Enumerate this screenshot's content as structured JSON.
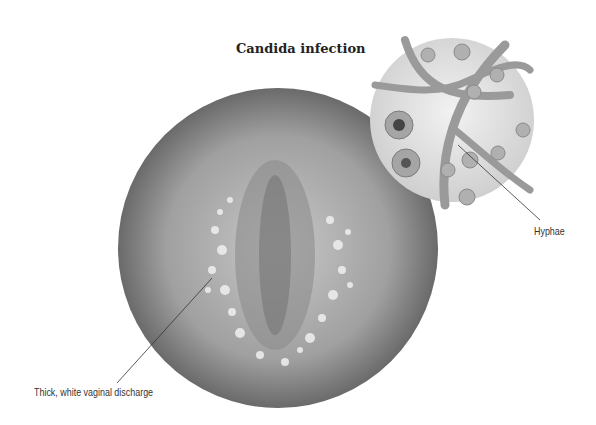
{
  "figure": {
    "title": "Candida infection",
    "labels": {
      "discharge": "Thick, white vaginal discharge",
      "hyphae": "Hyphae"
    },
    "palette": {
      "main_circle_fill": "#a9a9a9",
      "main_circle_edge": "#6f6f6f",
      "inset_fill": "#e4e4e4",
      "hyphae_color": "#9a9a9a",
      "spot_color": "#f2f2f2",
      "leader_line": "#333333"
    }
  }
}
